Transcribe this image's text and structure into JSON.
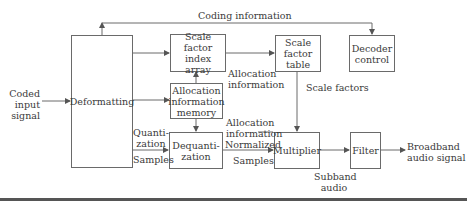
{
  "diagram": {
    "type": "block-diagram",
    "blocks": {
      "deformatting": "Deformatting",
      "scale_factor_index_array": [
        "Scale factor",
        "index",
        "array"
      ],
      "allocation_information_memory": [
        "Allocation",
        "information",
        "memory"
      ],
      "dequantization": [
        "Dequanti-",
        "zation"
      ],
      "scale_factor_table": [
        "Scale",
        "factor",
        "table"
      ],
      "decoder_control": [
        "Decoder",
        "control"
      ],
      "multiplier": "Multiplier",
      "filter": "Filter"
    },
    "labels": {
      "input": [
        "Coded",
        "input",
        "signal"
      ],
      "coding_information": "Coding information",
      "allocation_information_upper": [
        "Allocation",
        "information"
      ],
      "scale_factors": "Scale factors",
      "quantization": [
        "Quanti-",
        "zation"
      ],
      "samples_left": "Samples",
      "allocation_information_lower": [
        "Allocation",
        "information"
      ],
      "normalized": "Normalized",
      "samples_right": "Samples",
      "subband_audio": [
        "Subband",
        "audio"
      ],
      "output": [
        "Broadband",
        "audio signal"
      ]
    },
    "colors": {
      "line": "#6a6a6a",
      "text": "#3a3a3a",
      "rule": "#555555"
    }
  }
}
